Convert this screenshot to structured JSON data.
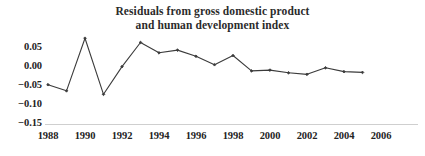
{
  "chart_data": {
    "type": "line",
    "title": "Residuals from gross domestic product and human development index",
    "title_lines": [
      "Residuals from gross domestic product",
      "and human development index"
    ],
    "xlabel": "",
    "ylabel": "",
    "grid": false,
    "legend": null,
    "line_color": "#3b3b3b",
    "marker": "diamond",
    "marker_color": "#3b3b3b",
    "xlim": [
      1988,
      2006
    ],
    "ylim": [
      -0.15,
      0.085
    ],
    "xticks": [
      1988,
      1990,
      1992,
      1994,
      1996,
      1998,
      2000,
      2002,
      2004,
      2006
    ],
    "xtick_labels": [
      "1988",
      "1990",
      "1992",
      "1994",
      "1996",
      "1998",
      "2000",
      "2002",
      "2004",
      "2006"
    ],
    "yticks": [
      0.05,
      0.0,
      -0.05,
      -0.1,
      -0.15
    ],
    "ytick_labels": [
      "0.05",
      "0.00",
      "−0.05",
      "−0.10",
      "−0.15"
    ],
    "x": [
      1988,
      1989,
      1990,
      1991,
      1992,
      1993,
      1994,
      1995,
      1996,
      1997,
      1998,
      1999,
      2000,
      2001,
      2002,
      2003,
      2004,
      2005
    ],
    "values": [
      -0.05,
      -0.066,
      0.071,
      -0.075,
      -0.003,
      0.06,
      0.033,
      0.04,
      0.024,
      0.002,
      0.026,
      -0.014,
      -0.012,
      -0.019,
      -0.023,
      -0.006,
      -0.016,
      -0.018
    ],
    "series": [
      {
        "name": "Residuals",
        "values": [
          -0.05,
          -0.066,
          0.071,
          -0.075,
          -0.003,
          0.06,
          0.033,
          0.04,
          0.024,
          0.002,
          0.026,
          -0.014,
          -0.012,
          -0.019,
          -0.023,
          -0.006,
          -0.016,
          -0.018
        ]
      }
    ]
  }
}
